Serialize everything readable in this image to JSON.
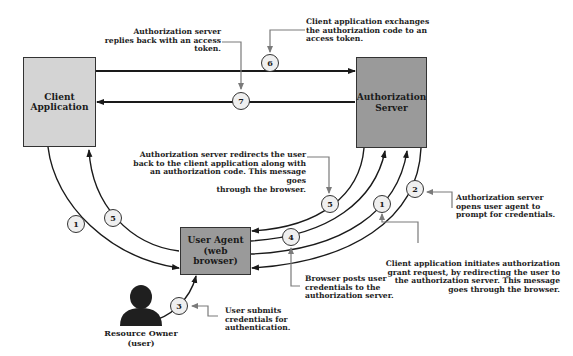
{
  "nodes": {
    "client": {
      "line1": "Client",
      "line2": "Application"
    },
    "auth_server": {
      "line1": "Authorization",
      "line2": "Server"
    },
    "user_agent": {
      "line1": "User Agent",
      "line2": "(web browser)"
    },
    "resource_owner": {
      "line1": "Resource Owner",
      "line2": "(user)"
    }
  },
  "steps": [
    {
      "id": "1",
      "label": "1"
    },
    {
      "id": "2",
      "label": "2"
    },
    {
      "id": "3",
      "label": "3"
    },
    {
      "id": "4",
      "label": "4"
    },
    {
      "id": "5",
      "label": "5"
    },
    {
      "id": "6",
      "label": "6"
    },
    {
      "id": "7",
      "label": "7"
    }
  ],
  "annotations": {
    "step7": [
      "Authorization server",
      "replies back with an access",
      "token."
    ],
    "step6": [
      "Client application exchanges",
      "the authorization code to an",
      "access token."
    ],
    "step5": [
      "Authorization server redirects the user",
      "back to the client application along with",
      "an authorization code. This message goes",
      "through the browser."
    ],
    "step2": [
      "Authorization server",
      "opens user agent to",
      "prompt for  credentials."
    ],
    "step1": [
      "Client application initiates authorization",
      "grant request, by redirecting the user to",
      "the authorization server. This message",
      "goes through the browser."
    ],
    "step4": [
      "Browser posts user",
      "credentials to the",
      "authorization server."
    ],
    "step3": [
      "User submits",
      "credentials for",
      "authentication."
    ]
  },
  "colors": {
    "client_fill": "#d4d4d4",
    "server_fill": "#9a9a9a",
    "line": "#1a1a1a",
    "callout": "#7a7a7a",
    "circle_fill": "#efefef"
  }
}
